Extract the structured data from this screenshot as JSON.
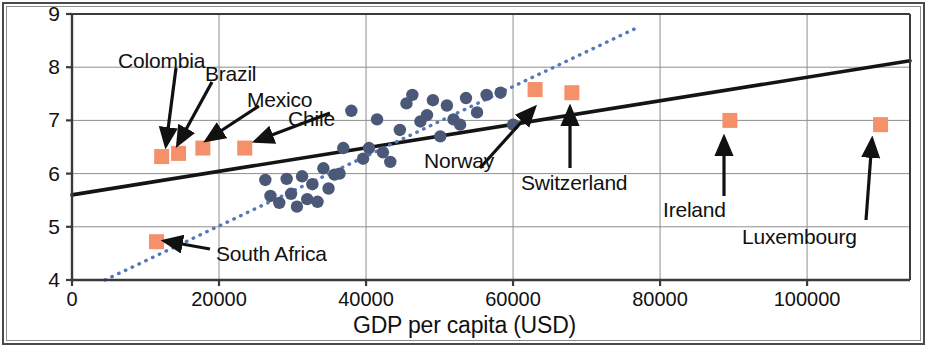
{
  "chart_data": {
    "type": "scatter",
    "title": "",
    "xlabel": "GDP per capita (USD)",
    "ylabel": "Life satisfaction",
    "xlim": [
      0,
      114000
    ],
    "ylim": [
      4,
      9
    ],
    "xticks": [
      0,
      20000,
      40000,
      60000,
      80000,
      100000
    ],
    "xtick_labels": [
      "0",
      "20000",
      "40000",
      "60000",
      "80000",
      "100000"
    ],
    "yticks": [
      4,
      5,
      6,
      7,
      8,
      9
    ],
    "ytick_labels": [
      "4",
      "5",
      "6",
      "7",
      "8",
      "9"
    ],
    "grid": true,
    "legend": "none",
    "colors": {
      "highlight_marker": "#f4906a",
      "scatter_marker": "#4c5878",
      "solid_fit_line": "#141414",
      "dotted_fit_line": "#5577bb",
      "grid": "#8f8f8f",
      "axis": "#3a3a3a",
      "annotation_text": "#111111"
    },
    "series": [
      {
        "name": "highlighted countries",
        "marker": "square",
        "color": "#f4906a",
        "points": [
          {
            "label": "South Africa",
            "x": 11500,
            "y": 4.72
          },
          {
            "label": "Colombia",
            "x": 12200,
            "y": 6.32
          },
          {
            "label": "Brazil",
            "x": 14500,
            "y": 6.38
          },
          {
            "label": "Mexico",
            "x": 17800,
            "y": 6.48
          },
          {
            "label": "Chile",
            "x": 23500,
            "y": 6.48
          },
          {
            "label": "Norway",
            "x": 63000,
            "y": 7.58
          },
          {
            "label": "Switzerland",
            "x": 68000,
            "y": 7.52
          },
          {
            "label": "Ireland",
            "x": 89500,
            "y": 7.0
          },
          {
            "label": "Luxembourg",
            "x": 110000,
            "y": 6.92
          }
        ]
      },
      {
        "name": "other countries",
        "marker": "circle",
        "color": "#4c5878",
        "points": [
          {
            "x": 26300,
            "y": 5.88
          },
          {
            "x": 27000,
            "y": 5.58
          },
          {
            "x": 28200,
            "y": 5.45
          },
          {
            "x": 29200,
            "y": 5.9
          },
          {
            "x": 29800,
            "y": 5.62
          },
          {
            "x": 30600,
            "y": 5.38
          },
          {
            "x": 31300,
            "y": 5.95
          },
          {
            "x": 32000,
            "y": 5.52
          },
          {
            "x": 32700,
            "y": 5.8
          },
          {
            "x": 33400,
            "y": 5.47
          },
          {
            "x": 34200,
            "y": 6.1
          },
          {
            "x": 34900,
            "y": 5.72
          },
          {
            "x": 35700,
            "y": 5.98
          },
          {
            "x": 36400,
            "y": 6.0
          },
          {
            "x": 36900,
            "y": 6.48
          },
          {
            "x": 38000,
            "y": 7.18
          },
          {
            "x": 39600,
            "y": 6.28
          },
          {
            "x": 40400,
            "y": 6.48
          },
          {
            "x": 41500,
            "y": 7.02
          },
          {
            "x": 42300,
            "y": 6.4
          },
          {
            "x": 43300,
            "y": 6.22
          },
          {
            "x": 44600,
            "y": 6.82
          },
          {
            "x": 45500,
            "y": 7.32
          },
          {
            "x": 46300,
            "y": 7.48
          },
          {
            "x": 47400,
            "y": 6.98
          },
          {
            "x": 48300,
            "y": 7.1
          },
          {
            "x": 49100,
            "y": 7.38
          },
          {
            "x": 50100,
            "y": 6.7
          },
          {
            "x": 51000,
            "y": 7.28
          },
          {
            "x": 51900,
            "y": 7.02
          },
          {
            "x": 52800,
            "y": 6.92
          },
          {
            "x": 53600,
            "y": 7.42
          },
          {
            "x": 55100,
            "y": 7.15
          },
          {
            "x": 56400,
            "y": 7.48
          },
          {
            "x": 58300,
            "y": 7.52
          },
          {
            "x": 60000,
            "y": 6.92
          }
        ]
      }
    ],
    "fit_lines": [
      {
        "name": "solid linear fit",
        "style": "solid",
        "color": "#141414",
        "x_start": 0,
        "y_start": 5.6,
        "x_end": 114000,
        "y_end": 8.12
      },
      {
        "name": "dotted linear fit",
        "style": "dotted",
        "color": "#5577bb",
        "x_start": 4500,
        "y_start": 4.0,
        "x_end": 77000,
        "y_end": 8.75
      }
    ],
    "annotations": [
      {
        "label": "Colombia",
        "text_x": 118,
        "text_y": 50,
        "arrow_from_x": 176,
        "arrow_from_y": 68,
        "arrow_to_x": 166,
        "arrow_to_y": 145
      },
      {
        "label": "Brazil",
        "text_x": 205,
        "text_y": 63,
        "arrow_from_x": 212,
        "arrow_from_y": 82,
        "arrow_to_x": 178,
        "arrow_to_y": 144
      },
      {
        "label": "Mexico",
        "text_x": 247,
        "text_y": 89,
        "arrow_from_x": 259,
        "arrow_from_y": 106,
        "arrow_to_x": 207,
        "arrow_to_y": 140
      },
      {
        "label": "Chile",
        "text_x": 288,
        "text_y": 108,
        "arrow_from_x": 330,
        "arrow_from_y": 113,
        "arrow_to_x": 256,
        "arrow_to_y": 141
      },
      {
        "label": "Norway",
        "text_x": 424,
        "text_y": 150,
        "arrow_from_x": 480,
        "arrow_from_y": 168,
        "arrow_to_x": 534,
        "arrow_to_y": 108
      },
      {
        "label": "Switzerland",
        "text_x": 521,
        "text_y": 172,
        "arrow_from_x": 570,
        "arrow_from_y": 168,
        "arrow_to_x": 570,
        "arrow_to_y": 108
      },
      {
        "label": "Ireland",
        "text_x": 663,
        "text_y": 199,
        "arrow_from_x": 724,
        "arrow_from_y": 196,
        "arrow_to_x": 724,
        "arrow_to_y": 138
      },
      {
        "label": "Luxembourg",
        "text_x": 742,
        "text_y": 226,
        "arrow_from_x": 866,
        "arrow_from_y": 220,
        "arrow_to_x": 872,
        "arrow_to_y": 140
      },
      {
        "label": "South Africa",
        "text_x": 216,
        "text_y": 243,
        "arrow_from_x": 210,
        "arrow_from_y": 249,
        "arrow_to_x": 165,
        "arrow_to_y": 241
      }
    ]
  }
}
